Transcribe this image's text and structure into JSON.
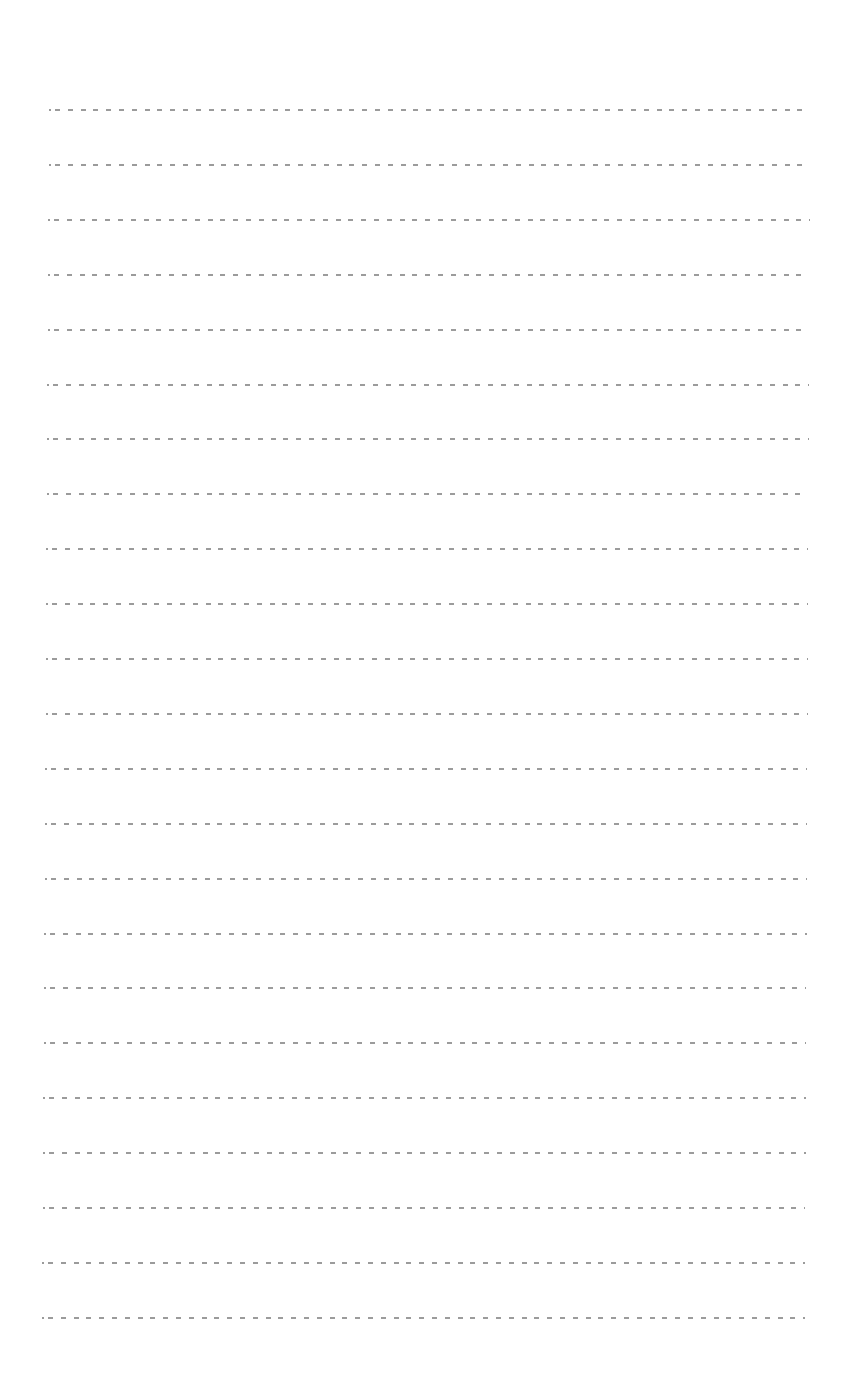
{
  "page": {
    "type": "ruled-sheet",
    "background_color": "#ffffff",
    "line_color": "#8a8a8a",
    "line_style": "dashed",
    "line_count": 23,
    "first_line_y": 109,
    "line_spacing": 54.9,
    "line_left_top": 49,
    "line_right_top": 810,
    "line_left_bottom": 42,
    "line_right_bottom": 805,
    "text_content": []
  }
}
